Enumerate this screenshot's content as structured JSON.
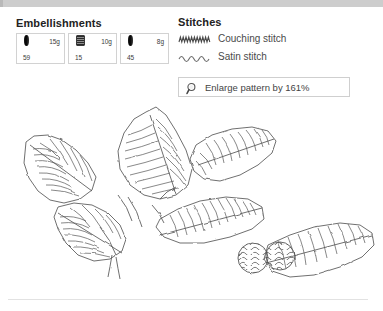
{
  "window": {
    "top_bar_color": "#cdcdcd",
    "background": "#ffffff"
  },
  "embellishments": {
    "title": "Embellishments",
    "items": [
      {
        "icon": "bead-icon",
        "weight": "15g",
        "code": "59"
      },
      {
        "icon": "spool-icon",
        "weight": "10g",
        "code": "15"
      },
      {
        "icon": "bead-icon",
        "weight": "8g",
        "code": "45"
      }
    ]
  },
  "stitches": {
    "title": "Stitches",
    "items": [
      {
        "glyph": "couching-stitch-icon",
        "label": "Couching stitch"
      },
      {
        "glyph": "satin-stitch-icon",
        "label": "Satin stitch"
      }
    ]
  },
  "enlarge": {
    "icon": "magnifier-icon",
    "label": "Enlarge pattern by 161%"
  },
  "pattern": {
    "name": "holly-branch-embroidery-pattern",
    "line_color": "#555555",
    "description": "Holly branch with hatched leaves and wavy-filled berries"
  }
}
